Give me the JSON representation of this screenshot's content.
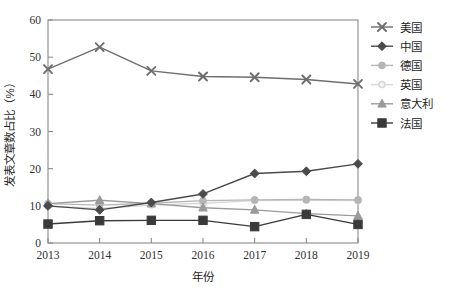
{
  "chart_data": {
    "type": "line",
    "title": "",
    "xlabel": "年份",
    "ylabel": "发表文章数占比（%）",
    "categories": [
      "2013",
      "2014",
      "2015",
      "2016",
      "2017",
      "2018",
      "2019"
    ],
    "x": [
      2013,
      2014,
      2015,
      2016,
      2017,
      2018,
      2019
    ],
    "xlim": [
      2013,
      2019
    ],
    "ylim": [
      0,
      60
    ],
    "yticks": [
      0,
      10,
      20,
      30,
      40,
      50,
      60
    ],
    "ytick_labels": [
      "0",
      "10",
      "20",
      "30",
      "40",
      "50",
      "60"
    ],
    "grid": false,
    "legend_position": "right",
    "series": [
      {
        "name": "美国",
        "marker": "x-cross",
        "color": "#6e6e6e",
        "values": [
          46.8,
          52.7,
          46.3,
          44.8,
          44.6,
          44.0,
          42.8
        ]
      },
      {
        "name": "中国",
        "marker": "diamond",
        "color": "#4a4a4a",
        "values": [
          10.0,
          8.9,
          10.9,
          13.2,
          18.7,
          19.3,
          21.3
        ]
      },
      {
        "name": "德国",
        "marker": "circle",
        "color": "#b5b5b5",
        "values": [
          10.6,
          10.2,
          10.7,
          11.4,
          11.6,
          11.7,
          11.6
        ]
      },
      {
        "name": "英国",
        "marker": "circle-small",
        "color": "#d8d8d8",
        "values": [
          9.9,
          9.3,
          10.2,
          10.7,
          11.4,
          11.5,
          11.4
        ]
      },
      {
        "name": "意大利",
        "marker": "triangle",
        "color": "#9a9a9a",
        "values": [
          10.6,
          11.5,
          10.6,
          9.5,
          8.9,
          7.9,
          7.3
        ]
      },
      {
        "name": "法国",
        "marker": "square",
        "color": "#3a3a3a",
        "values": [
          5.1,
          6.0,
          6.1,
          6.1,
          4.4,
          7.7,
          5.0
        ]
      }
    ]
  },
  "axes": {
    "y_title": "发表文章数占比（%）",
    "x_title": "年份"
  },
  "legend": {
    "items": [
      {
        "label": "美国"
      },
      {
        "label": "中国"
      },
      {
        "label": "德国"
      },
      {
        "label": "英国"
      },
      {
        "label": "意大利"
      },
      {
        "label": "法国"
      }
    ]
  }
}
